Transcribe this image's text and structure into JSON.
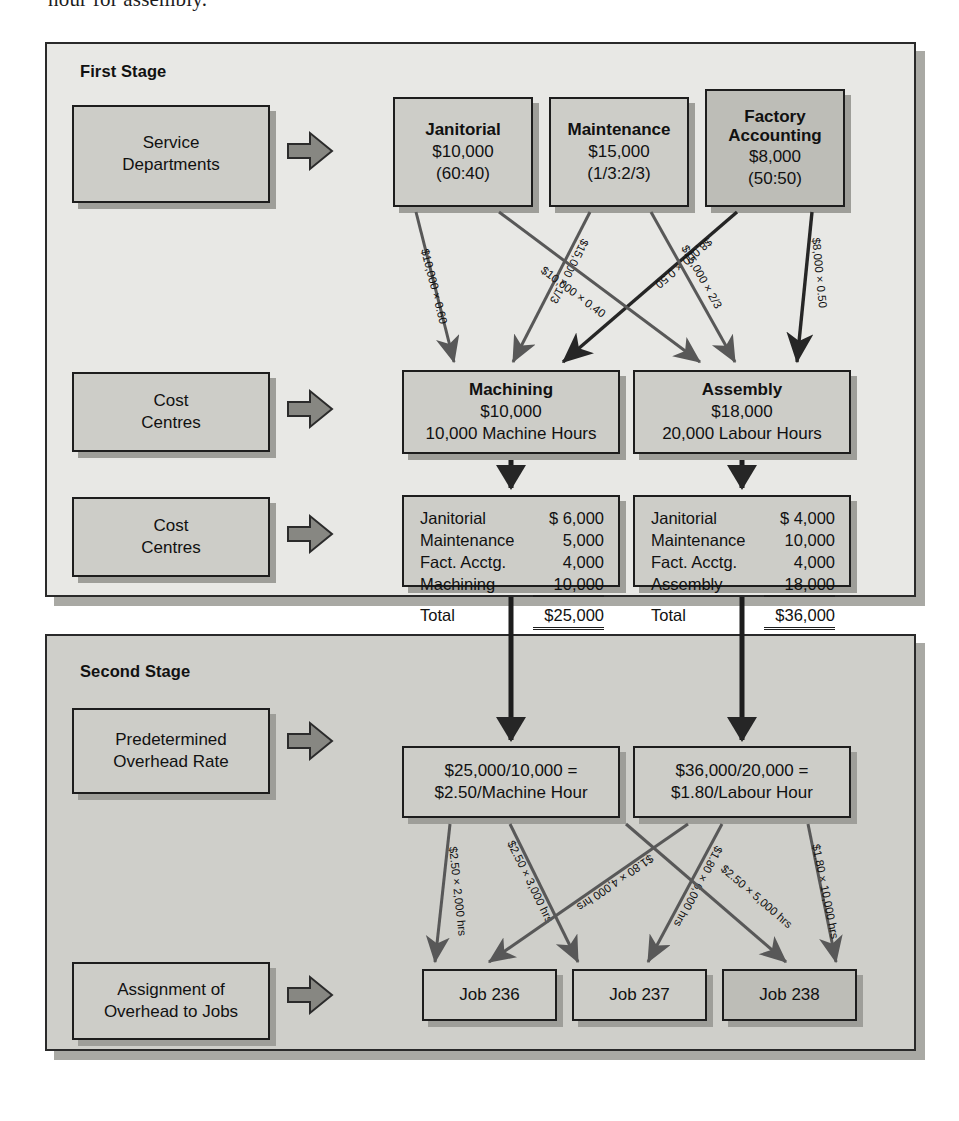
{
  "page": {
    "cut_off_text": "hour for assembly."
  },
  "first_stage": {
    "title": "First Stage",
    "row_labels": [
      {
        "line1": "Service",
        "line2": "Departments"
      },
      {
        "line1": "Cost",
        "line2": "Centres"
      },
      {
        "line1": "Cost",
        "line2": "Centres"
      }
    ],
    "service_departments": [
      {
        "name": "Janitorial",
        "amount": "$10,000",
        "ratio": "(60:40)"
      },
      {
        "name": "Maintenance",
        "amount": "$15,000",
        "ratio": "(1/3:2/3)"
      },
      {
        "name": "Factory Accounting",
        "amount": "$8,000",
        "ratio": "(50:50)"
      }
    ],
    "cost_centres": [
      {
        "name": "Machining",
        "amount": "$10,000",
        "base": "10,000 Machine Hours"
      },
      {
        "name": "Assembly",
        "amount": "$18,000",
        "base": "20,000 Labour Hours"
      }
    ],
    "allocation_labels": [
      "$10,000 × 0.60",
      "$15,000 × 1/3",
      "$8,000 × 0.50",
      "$10,000 × 0.40",
      "$15,000 × 2/3",
      "$8,000 × 0.50"
    ],
    "summaries": [
      {
        "rows": [
          {
            "label": "Janitorial",
            "value": "$  6,000"
          },
          {
            "label": "Maintenance",
            "value": "5,000"
          },
          {
            "label": "Fact. Acctg.",
            "value": "4,000"
          },
          {
            "label": "Machining",
            "value": "10,000"
          }
        ],
        "total_label": "Total",
        "total_value": "$25,000"
      },
      {
        "rows": [
          {
            "label": "Janitorial",
            "value": "$  4,000"
          },
          {
            "label": "Maintenance",
            "value": "10,000"
          },
          {
            "label": "Fact. Acctg.",
            "value": "4,000"
          },
          {
            "label": "Assembly",
            "value": "18,000"
          }
        ],
        "total_label": "Total",
        "total_value": "$36,000"
      }
    ]
  },
  "second_stage": {
    "title": "Second Stage",
    "row_labels": [
      {
        "line1": "Predetermined",
        "line2": "Overhead Rate"
      },
      {
        "line1": "Assignment of",
        "line2": "Overhead to Jobs"
      }
    ],
    "rates": [
      {
        "line1": "$25,000/10,000 =",
        "line2": "$2.50/Machine Hour"
      },
      {
        "line1": "$36,000/20,000 =",
        "line2": "$1.80/Labour Hour"
      }
    ],
    "application_labels": [
      "$2.50 × 2,000 hrs",
      "$2.50 × 3,000 hrs",
      "$1.80 × 4,000 hrs",
      "$1.80 × 6,000 hrs",
      "$2.50 × 5,000 hrs",
      "$1.80 × 10,000 hrs"
    ],
    "jobs": [
      "Job 236",
      "Job 237",
      "Job 238"
    ]
  },
  "colors": {
    "panel_first": "#e8e8e5",
    "panel_second": "#cfcfca",
    "box_fill": "#cdcdc8",
    "box_fill_dark": "#bdbdb7",
    "outline": "#1d1d1d",
    "shadow": "#9e9e99",
    "arrow_dark": "#262626",
    "arrow_grey": "#5c5c5c"
  }
}
